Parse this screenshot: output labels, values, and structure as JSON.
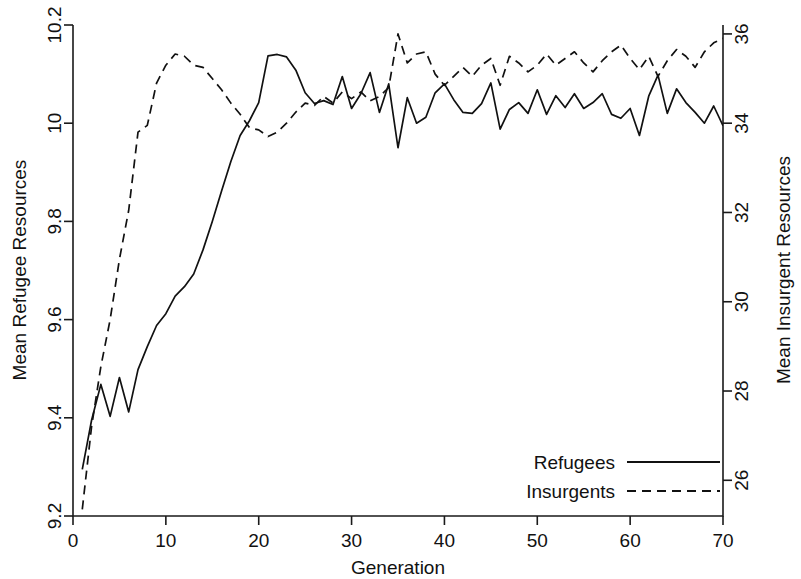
{
  "chart_data": {
    "type": "line",
    "title": "",
    "xlabel": "Generation",
    "ylabel": "Mean Refugee Resources",
    "ylabel_right": "Mean Insurgent Resources",
    "xlim": [
      0,
      70
    ],
    "ylim": [
      9.2,
      10.2
    ],
    "ylim_right": [
      25.2,
      36.2
    ],
    "grid": false,
    "legend_position": "bottom-right",
    "xticks": [
      0,
      10,
      20,
      30,
      40,
      50,
      60,
      70
    ],
    "xtick_labels": [
      "0",
      "10",
      "20",
      "30",
      "40",
      "50",
      "60",
      "70"
    ],
    "yticks": [
      9.2,
      9.4,
      9.6,
      9.8,
      10,
      10.2
    ],
    "ytick_labels": [
      "9.2",
      "9.4",
      "9.6",
      "9.8",
      "10",
      "10.2"
    ],
    "yticks_right": [
      26,
      28,
      30,
      32,
      34,
      36
    ],
    "ytick_labels_right": [
      "26",
      "28",
      "30",
      "32",
      "34",
      "36"
    ],
    "x": [
      1,
      2,
      3,
      4,
      5,
      6,
      7,
      8,
      9,
      10,
      11,
      12,
      13,
      14,
      15,
      16,
      17,
      18,
      19,
      20,
      21,
      22,
      23,
      24,
      25,
      26,
      27,
      28,
      29,
      30,
      31,
      32,
      33,
      34,
      35,
      36,
      37,
      38,
      39,
      40,
      41,
      42,
      43,
      44,
      45,
      46,
      47,
      48,
      49,
      50,
      51,
      52,
      53,
      54,
      55,
      56,
      57,
      58,
      59,
      60,
      61,
      62,
      63,
      64,
      65,
      66,
      67,
      68,
      69,
      70
    ],
    "series": [
      {
        "name": "Refugees",
        "axis": "left",
        "style": "solid",
        "values": [
          9.295,
          9.395,
          9.468,
          9.403,
          9.482,
          9.412,
          9.498,
          9.545,
          9.588,
          9.612,
          9.648,
          9.667,
          9.693,
          9.742,
          9.8,
          9.862,
          9.922,
          9.975,
          10.005,
          10.042,
          10.137,
          10.14,
          10.135,
          10.108,
          10.062,
          10.04,
          10.046,
          10.038,
          10.095,
          10.03,
          10.06,
          10.103,
          10.022,
          10.08,
          9.95,
          10.052,
          10.0,
          10.012,
          10.062,
          10.08,
          10.048,
          10.022,
          10.02,
          10.04,
          10.082,
          9.988,
          10.028,
          10.042,
          10.02,
          10.068,
          10.018,
          10.056,
          10.032,
          10.06,
          10.03,
          10.042,
          10.06,
          10.018,
          10.01,
          10.03,
          9.975,
          10.055,
          10.098,
          10.02,
          10.07,
          10.042,
          10.022,
          10.0,
          10.035,
          9.995
        ]
      },
      {
        "name": "Insurgents",
        "axis": "right",
        "style": "dashed",
        "values": [
          25.35,
          27.2,
          28.55,
          29.6,
          30.95,
          32.05,
          33.8,
          33.95,
          34.9,
          35.3,
          35.55,
          35.5,
          35.3,
          35.25,
          35.0,
          34.75,
          34.45,
          34.2,
          33.9,
          33.85,
          33.7,
          33.8,
          34.0,
          34.25,
          34.45,
          34.4,
          34.6,
          34.45,
          34.7,
          34.55,
          34.7,
          34.5,
          34.6,
          34.8,
          36.0,
          35.35,
          35.55,
          35.6,
          35.1,
          34.85,
          35.05,
          35.25,
          35.05,
          35.3,
          35.45,
          34.85,
          35.5,
          35.35,
          35.15,
          35.3,
          35.55,
          35.3,
          35.45,
          35.6,
          35.35,
          35.15,
          35.4,
          35.6,
          35.75,
          35.45,
          35.2,
          35.5,
          35.05,
          35.4,
          35.65,
          35.5,
          35.25,
          35.6,
          35.8,
          35.9
        ]
      }
    ]
  },
  "legend": {
    "items": [
      {
        "label": "Refugees",
        "style": "solid"
      },
      {
        "label": "Insurgents",
        "style": "dashed"
      }
    ]
  }
}
